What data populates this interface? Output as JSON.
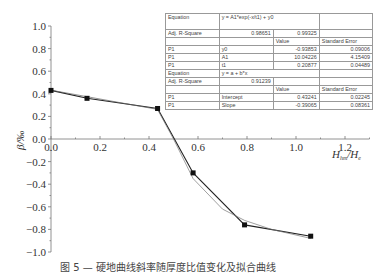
{
  "chart_data": {
    "type": "line",
    "title": "",
    "xlabel": "H_hm/H_e",
    "ylabel": "β/‰",
    "xlim": [
      0.0,
      1.3
    ],
    "ylim": [
      -1.0,
      1.0
    ],
    "x_ticks": [
      "0.0",
      "0.2",
      "0.4",
      "0.6",
      "0.8",
      "1.0",
      "1.2"
    ],
    "y_ticks": [
      "1.0",
      "0.8",
      "0.6",
      "0.4",
      "0.2",
      "0.0",
      "-0.2",
      "-0.4",
      "-0.6",
      "-0.8",
      "-1.0"
    ],
    "grid": false,
    "series": [
      {
        "name": "measured",
        "marker": "square",
        "x": [
          0.0,
          0.147,
          0.435,
          0.58,
          0.79,
          1.06
        ],
        "y": [
          0.43,
          0.36,
          0.27,
          -0.3,
          -0.76,
          -0.86
        ]
      },
      {
        "name": "linear fit (segment 1)",
        "equation": "y = a + b*x",
        "x": [
          0.0,
          0.435
        ],
        "y": [
          0.432,
          0.262
        ]
      },
      {
        "name": "exponential fit (segment 2)",
        "equation": "y = A1*exp(-x/t1) + y0",
        "x": [
          0.435,
          0.5,
          0.58,
          0.7,
          0.79,
          0.9,
          1.06
        ],
        "y": [
          0.26,
          0.0,
          -0.35,
          -0.62,
          -0.72,
          -0.8,
          -0.88
        ]
      }
    ]
  },
  "table": {
    "rows": [
      [
        "Equation",
        "y = A1*exp(-x/t1) + y0",
        "",
        ""
      ],
      [
        "Adj. R-Square",
        "0.98651",
        "0.99325",
        ""
      ],
      [
        "",
        "",
        "Value",
        "Standard Error"
      ],
      [
        "P1",
        "y0",
        "-0.93853",
        "0.09006"
      ],
      [
        "P1",
        "A1",
        "10.04226",
        "4.15409"
      ],
      [
        "P1",
        "t1",
        "0.20877",
        "0.04489"
      ],
      [
        "Equation",
        "y = a + b*x",
        "",
        ""
      ],
      [
        "Adj. R-Square",
        "0.91239",
        "",
        ""
      ],
      [
        "",
        "",
        "Value",
        "Standard Error"
      ],
      [
        "P1",
        "Intercept",
        "0.43241",
        "0.02245"
      ],
      [
        "P1",
        "Slope",
        "-0.39065",
        "0.08361"
      ]
    ]
  },
  "caption": "图 5 — 硬地曲线斜率随厚度比值变化及拟合曲线"
}
